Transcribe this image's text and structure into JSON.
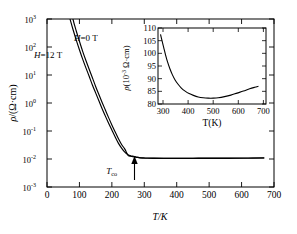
{
  "figure": {
    "name": "resistivity-vs-temperature-figure"
  },
  "main_axes": {
    "xlabel": "T/K",
    "ylabel_rho": "ρ",
    "ylabel_units": "/(Ω·cm)",
    "xticks": [
      "0",
      "100",
      "200",
      "300",
      "400",
      "500",
      "600",
      "700"
    ],
    "xtick_values": [
      0,
      100,
      200,
      300,
      400,
      500,
      600,
      700
    ],
    "yticks": [
      "10",
      "10",
      "10",
      "10",
      "10",
      "10",
      "10"
    ],
    "yexponents": [
      "3",
      "2",
      "1",
      "0",
      "-1",
      "-2",
      "-3"
    ],
    "ytick_values": [
      3,
      2,
      1,
      0,
      -1,
      -2,
      -3
    ],
    "xlim": [
      0,
      700
    ],
    "ylim_log10": [
      -3,
      3
    ],
    "grid": false
  },
  "annotations": {
    "h0_label": "H=0 T",
    "h12_label": "H=12 T",
    "tco_label": "T",
    "tco_sub": "co",
    "tco_value": 270,
    "arrow": "up-arrow"
  },
  "inset_axes": {
    "xlabel": "T(K)",
    "ylabel_rho": "ρ",
    "ylabel_units": "(10",
    "ylabel_exp": "-3",
    "ylabel_units2": " Ω·cm)",
    "xticks": [
      "300",
      "400",
      "500",
      "600",
      "700"
    ],
    "xtick_values": [
      300,
      400,
      500,
      600,
      700
    ],
    "yticks": [
      "80",
      "85",
      "90",
      "95",
      "100",
      "105",
      "110"
    ],
    "ytick_values": [
      80,
      85,
      90,
      95,
      100,
      105,
      110
    ],
    "xlim": [
      280,
      710
    ],
    "ylim": [
      80,
      110
    ],
    "grid": false
  },
  "chart_data": [
    {
      "type": "line",
      "id": "main-plot",
      "title": "",
      "xlabel": "T/K",
      "ylabel": "ρ/(Ω·cm)",
      "xlim": [
        0,
        700
      ],
      "ylim": [
        0.001,
        1000
      ],
      "yscale": "log",
      "xscale": "linear",
      "grid": false,
      "legend": [
        "H=0 T",
        "H=12 T"
      ],
      "legend_position": "inside-upper-left",
      "series": [
        {
          "name": "H=0 T",
          "x": [
            60,
            70,
            80,
            90,
            100,
            110,
            120,
            130,
            140,
            150,
            160,
            170,
            180,
            190,
            200,
            210,
            220,
            230,
            240,
            250,
            258,
            264,
            268,
            272,
            278,
            285,
            295,
            310,
            330,
            360,
            400,
            450,
            500,
            560,
            620,
            670
          ],
          "y": [
            3000,
            1100,
            430,
            180,
            80,
            37,
            18,
            9.0,
            4.4,
            2.3,
            1.2,
            0.62,
            0.34,
            0.19,
            0.108,
            0.062,
            0.037,
            0.0245,
            0.0175,
            0.0142,
            0.0131,
            0.0127,
            0.0124,
            0.0121,
            0.0117,
            0.01135,
            0.0111,
            0.01085,
            0.01075,
            0.01068,
            0.01065,
            0.01068,
            0.0107,
            0.01075,
            0.01085,
            0.011
          ]
        },
        {
          "name": "H=12 T",
          "x": [
            72,
            80,
            90,
            100,
            110,
            120,
            130,
            140,
            150,
            160,
            170,
            180,
            190,
            200,
            210,
            220,
            230,
            240,
            250,
            258,
            264,
            268,
            272,
            278,
            285,
            295,
            310,
            330,
            360,
            400,
            450,
            500,
            560,
            620,
            670
          ],
          "y": [
            3000,
            1000,
            380,
            160,
            70,
            33,
            16,
            8.0,
            3.9,
            2.0,
            1.05,
            0.56,
            0.3,
            0.165,
            0.094,
            0.054,
            0.033,
            0.0225,
            0.0136,
            0.0126,
            0.0122,
            0.0119,
            0.0117,
            0.01135,
            0.011,
            0.0108,
            0.01062,
            0.01055,
            0.0105,
            0.01048,
            0.0105,
            0.01053,
            0.01058,
            0.01068,
            0.01085
          ]
        }
      ],
      "annotations": [
        {
          "text": "T_co",
          "x": 270,
          "y": 0.0023,
          "type": "arrow-up"
        }
      ]
    },
    {
      "type": "line",
      "id": "inset-plot",
      "title": "",
      "xlabel": "T(K)",
      "ylabel": "ρ(10⁻³ Ω·cm)",
      "xlim": [
        280,
        710
      ],
      "ylim": [
        80,
        110
      ],
      "yscale": "linear",
      "xscale": "linear",
      "grid": false,
      "series": [
        {
          "name": "rho-inset",
          "x": [
            290,
            296,
            303,
            310,
            318,
            327,
            337,
            348,
            360,
            373,
            388,
            404,
            421,
            440,
            460,
            480,
            500,
            520,
            545,
            570,
            595,
            620,
            645,
            665,
            680
          ],
          "y": [
            107.5,
            105.0,
            102.2,
            99.4,
            96.6,
            94.0,
            91.6,
            89.5,
            87.8,
            86.3,
            85.1,
            84.1,
            83.4,
            82.8,
            82.45,
            82.3,
            82.3,
            82.45,
            82.9,
            83.5,
            84.3,
            85.1,
            86.0,
            86.6,
            87.0
          ]
        }
      ]
    }
  ]
}
